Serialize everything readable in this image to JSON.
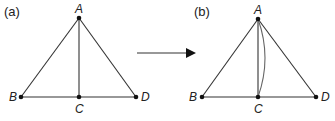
{
  "panels": [
    {
      "label": "(a)",
      "points": {
        "A": "A",
        "B": "B",
        "C": "C",
        "D": "D"
      },
      "description": "Triangle ABD with segment AC"
    },
    {
      "label": "(b)",
      "points": {
        "A": "A",
        "B": "B",
        "C": "C",
        "D": "D"
      },
      "description": "Triangle ABD with segment AC and curved arc from A to C"
    }
  ],
  "arrow": "right-arrow",
  "colors": {
    "line": "#333333",
    "point": "#111111",
    "arc": "#666666"
  }
}
